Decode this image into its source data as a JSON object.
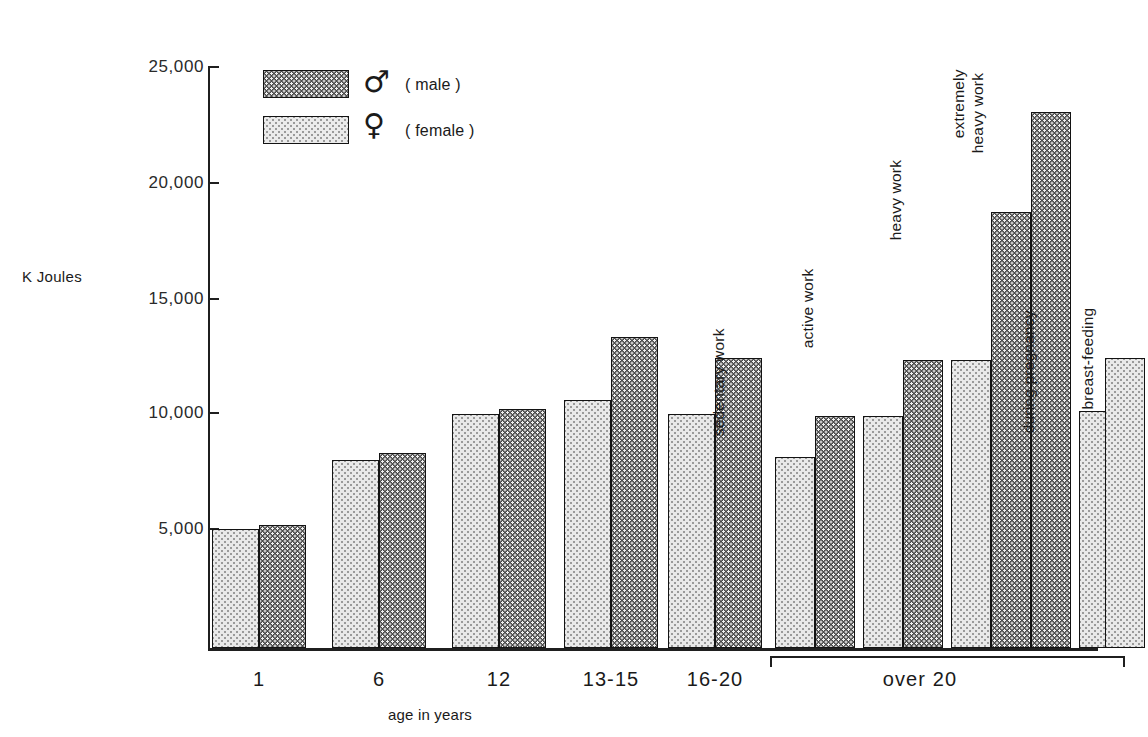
{
  "chart_data": {
    "type": "bar",
    "title": "",
    "ylabel": "K Joules",
    "xlabel": "age in years",
    "ylim": [
      0,
      26000
    ],
    "yticks": [
      5000,
      10000,
      15000,
      20000,
      25000
    ],
    "ytick_labels": [
      "5,000",
      "10,000",
      "15,000",
      "20,000",
      "25,000"
    ],
    "grid": false,
    "legend_position": "top-left",
    "series": [
      {
        "name": "male",
        "symbol": "♂",
        "label": "( male )",
        "color": "#4a4a4a"
      },
      {
        "name": "female",
        "symbol": "♀",
        "label": "( female )",
        "color": "#e9e9e9"
      }
    ],
    "groups": [
      {
        "label": "1",
        "bars": [
          {
            "series": "female",
            "value": 5150,
            "note": ""
          },
          {
            "series": "male",
            "value": 5300,
            "note": ""
          }
        ]
      },
      {
        "label": "6",
        "bars": [
          {
            "series": "female",
            "value": 8100,
            "note": ""
          },
          {
            "series": "male",
            "value": 8400,
            "note": ""
          }
        ]
      },
      {
        "label": "12",
        "bars": [
          {
            "series": "female",
            "value": 10100,
            "note": ""
          },
          {
            "series": "male",
            "value": 10300,
            "note": ""
          }
        ]
      },
      {
        "label": "13-15",
        "bars": [
          {
            "series": "female",
            "value": 10700,
            "note": ""
          },
          {
            "series": "male",
            "value": 13400,
            "note": ""
          }
        ]
      },
      {
        "label": "16-20",
        "bars": [
          {
            "series": "female",
            "value": 10100,
            "note": ""
          },
          {
            "series": "male",
            "value": 12500,
            "note": ""
          }
        ]
      },
      {
        "label": "over 20",
        "bracketed": true,
        "bars": [
          {
            "series": "female",
            "value": 8250,
            "note": "sedentary work"
          },
          {
            "series": "male",
            "value": 10000,
            "note": ""
          },
          {
            "series": "female",
            "value": 10000,
            "note": "active work"
          },
          {
            "series": "male",
            "value": 12400,
            "note": ""
          },
          {
            "series": "female",
            "value": 12400,
            "note": ""
          },
          {
            "series": "male",
            "value": 18800,
            "note": "heavy work"
          },
          {
            "series": "male",
            "value": 23100,
            "note": "extremely\nheavy work"
          },
          {
            "series": "female",
            "value": 10200,
            "note": "during pregnancy"
          },
          {
            "series": "female",
            "value": 12500,
            "note": "during breast-feeding"
          }
        ]
      }
    ]
  },
  "axis": {
    "y_title": "K Joules",
    "x_title": "age in years",
    "ytick_0": "25,000",
    "ytick_1": "20,000",
    "ytick_2": "15,000",
    "ytick_3": "10,000",
    "ytick_4": "5,000"
  },
  "legend": {
    "male_symbol": "♂",
    "male_text": "( male )",
    "female_symbol": "♀",
    "female_text": "( female )"
  },
  "groups": {
    "g0": "1",
    "g1": "6",
    "g2": "12",
    "g3": "13-15",
    "g4": "16-20",
    "g5": "over 20"
  },
  "notes": {
    "sedentary": "sedentary work",
    "active": "active work",
    "heavy": "heavy work",
    "extremely_heavy_l1": "extremely",
    "extremely_heavy_l2": "heavy work",
    "pregnancy": "during pregnancy",
    "breastfeeding": "during breast-feeding"
  }
}
